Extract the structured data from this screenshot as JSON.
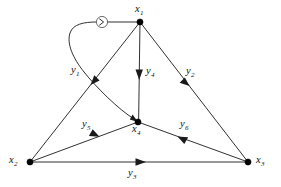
{
  "diagram": {
    "background_color": "#ffffff",
    "line_color": "#1a1a1a",
    "node_color": "#000000",
    "marker_color": "#4a4a4a",
    "width": 281,
    "height": 187
  },
  "nodes": [
    {
      "id": "x1",
      "base": "x",
      "sub": "1",
      "label": "x₁",
      "x": 140,
      "y": 22,
      "label_x": 135,
      "label_y": 4,
      "label_align": "above"
    },
    {
      "id": "x2",
      "base": "x",
      "sub": "2",
      "label": "x₂",
      "x": 30,
      "y": 162,
      "label_x": 9,
      "label_y": 155,
      "label_align": "left"
    },
    {
      "id": "x3",
      "base": "x",
      "sub": "3",
      "label": "x₃",
      "x": 248,
      "y": 162,
      "label_x": 256,
      "label_y": 155,
      "label_align": "right"
    },
    {
      "id": "x4",
      "base": "x",
      "sub": "4",
      "label": "x₄",
      "x": 138,
      "y": 122,
      "label_x": 132,
      "label_y": 124,
      "label_align": "below"
    }
  ],
  "edges": [
    {
      "id": "y1",
      "base": "y",
      "sub": "1",
      "label": "y₁",
      "from": "x1",
      "to": "x2",
      "kind": "straight",
      "label_x": 71,
      "label_y": 65,
      "arrow_t": 0.42
    },
    {
      "id": "y2",
      "base": "y",
      "sub": "2",
      "label": "y₂",
      "from": "x1",
      "to": "x3",
      "kind": "straight",
      "label_x": 186,
      "label_y": 66,
      "arrow_t": 0.45
    },
    {
      "id": "y3",
      "base": "y",
      "sub": "3",
      "label": "y₃",
      "from": "x2",
      "to": "x3",
      "kind": "straight",
      "label_x": 128,
      "label_y": 168,
      "arrow_t": 0.5
    },
    {
      "id": "y4",
      "base": "y",
      "sub": "4",
      "label": "y₄",
      "from": "x1",
      "to": "x4",
      "kind": "straight",
      "label_x": 146,
      "label_y": 66,
      "arrow_t": 0.52
    },
    {
      "id": "y5",
      "base": "y",
      "sub": "5",
      "label": "y₅",
      "from": "x2",
      "to": "x4",
      "kind": "straight",
      "label_x": 82,
      "label_y": 119,
      "arrow_t": 0.55
    },
    {
      "id": "y6",
      "base": "y",
      "sub": "6",
      "label": "y₆",
      "from": "x3",
      "to": "x4",
      "kind": "straight",
      "label_x": 180,
      "label_y": 119,
      "arrow_t": 0.55
    }
  ],
  "curve": {
    "id": "loop-arc",
    "description": "curved arc from x1 leftward through circled arrow marker, looping down to x4",
    "from": "x1",
    "to": "x4",
    "marker_x": 102,
    "marker_y": 22,
    "marker_radius": 5.6,
    "marker_glyph": "arrowhead-right"
  }
}
